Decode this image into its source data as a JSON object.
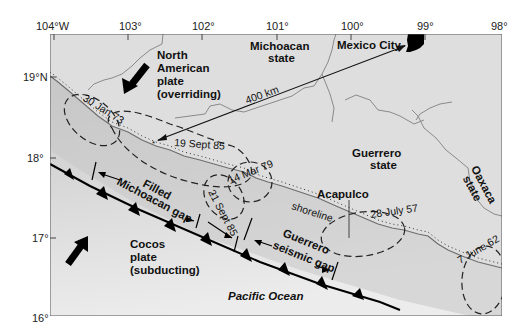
{
  "axes": {
    "longitude_ticks": [
      "104°W",
      "103°",
      "102°",
      "101°",
      "100°",
      "99°",
      "98°"
    ],
    "latitude_ticks": [
      "19°N",
      "18°",
      "17°",
      "16°"
    ]
  },
  "labels": {
    "north_american_plate": [
      "North",
      "American",
      "plate",
      "(overriding)"
    ],
    "cocos_plate": [
      "Cocos",
      "plate",
      "(subducting)"
    ],
    "michoacan_state": [
      "Michoacan",
      "state"
    ],
    "guerrero_state": [
      "Guerrero",
      "state"
    ],
    "oaxaca_state": [
      "Oaxaca",
      "state"
    ],
    "mexico_city": "Mexico City",
    "acapulco": "Acapulco",
    "distance": "400 km",
    "shoreline": "shoreline",
    "pacific_ocean": "Pacific Ocean",
    "filled_gap": [
      "Filled",
      "Michoacan gap"
    ],
    "seismic_gap": [
      "Guerrero",
      "seismic gap"
    ]
  },
  "earthquakes": [
    {
      "label": "30 Jan 73"
    },
    {
      "label": "19 Sept 85"
    },
    {
      "label": "21 Sept 85"
    },
    {
      "label": "14 Mar 79"
    },
    {
      "label": "28 July 57"
    },
    {
      "label": "7 June 62"
    }
  ],
  "colors": {
    "land": "#dedede",
    "ocean_near": "#c4c4c4",
    "ocean_far": "#e6e6e6",
    "ink": "#111111"
  }
}
